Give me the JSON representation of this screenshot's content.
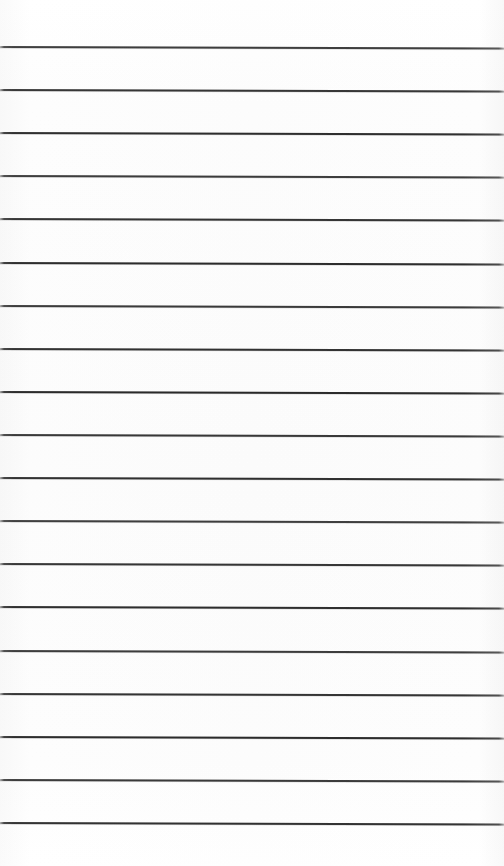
{
  "document": {
    "kind": "scanned-ruled-paper",
    "description": "Blank lined notepad page, no handwriting or printed text",
    "page_width": 504,
    "page_height": 866,
    "background_color": "#fdfdfd",
    "has_text": false,
    "has_margin_rule": false,
    "has_holes": false
  },
  "ruling": {
    "line_color": "#262626",
    "line_thickness": 2,
    "line_count": 19,
    "first_line_y": 47,
    "last_line_y": 823,
    "line_spacing": 43.1,
    "left_inset": 0,
    "right_inset": 0,
    "skew_degrees": 0.18,
    "line_positions_y": [
      47,
      90.1,
      133.2,
      176.3,
      219.4,
      262.6,
      305.7,
      348.8,
      391.9,
      435.0,
      478.1,
      521.2,
      564.3,
      607.4,
      650.6,
      693.7,
      736.8,
      779.9,
      823
    ]
  }
}
